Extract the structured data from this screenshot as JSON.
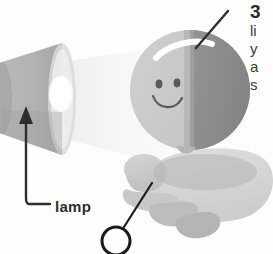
{
  "figure": {
    "title_number": "3",
    "clipped_paragraph_lines": [
      "li",
      "y",
      "a",
      "s"
    ],
    "background_color": "#fdfdfd"
  },
  "callouts": [
    {
      "id": "lamp",
      "label": "lamp",
      "marker": "arrow",
      "target": "lamp-cone"
    },
    {
      "id": "unlabeled-circle",
      "label": "",
      "marker": "circle",
      "target": "hand"
    },
    {
      "id": "head-leader",
      "label": "",
      "marker": "line",
      "target": "head-highlight"
    }
  ],
  "scene": {
    "lamp": {
      "name": "lamp",
      "body_color": "#b3b3b3",
      "body_shadow_color": "#a0a0a0",
      "aperture_color": "#ffffff",
      "rim_color": "#dddddd"
    },
    "light_beam": {
      "name": "light-beam",
      "color_near": "#f2f2f2",
      "color_far": "#fbfbfb"
    },
    "head": {
      "name": "head-sphere",
      "lit_half_color": "#c9c9c9",
      "shadow_half_color": "#8e8e8e",
      "highlight_color": "#ffffff",
      "face_line_color": "#555555",
      "expression": "smile"
    },
    "hand": {
      "name": "hand",
      "palm_color": "#d8d8d8",
      "finger_color": "#c6c6c6",
      "shadow_color": "#b8b8b8"
    },
    "line_color": "#2e2e2e"
  }
}
